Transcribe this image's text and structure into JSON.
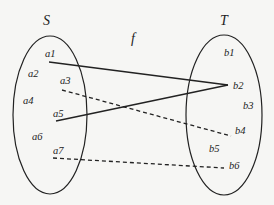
{
  "diagram": {
    "type": "mapping",
    "function_label": "f",
    "sets": [
      {
        "name": "S",
        "elements": [
          "a1",
          "a2",
          "a3",
          "a4",
          "a5",
          "a6",
          "a7"
        ]
      },
      {
        "name": "T",
        "elements": [
          "b1",
          "b2",
          "b3",
          "b4",
          "b5",
          "b6"
        ]
      }
    ],
    "mappings": [
      {
        "from": "a1",
        "to": "b2",
        "style": "solid"
      },
      {
        "from": "a5",
        "to": "b2",
        "style": "solid"
      },
      {
        "from": "a3",
        "to": "b4",
        "style": "dashed"
      },
      {
        "from": "a7",
        "to": "b6",
        "style": "dashed"
      }
    ]
  },
  "labels": {
    "S": "S",
    "T": "T",
    "f": "f",
    "a1": "a1",
    "a2": "a2",
    "a3": "a3",
    "a4": "a4",
    "a5": "a5",
    "a6": "a6",
    "a7": "a7",
    "b1": "b1",
    "b2": "b2",
    "b3": "b3",
    "b4": "b4",
    "b5": "b5",
    "b6": "b6"
  }
}
